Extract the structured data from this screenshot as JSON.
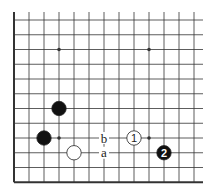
{
  "diagram": {
    "type": "go-board-fragment",
    "region": "lower-left corner",
    "colors": {
      "line": "#333333",
      "black_stone": "#111111",
      "white_stone": "#ffffff",
      "background": "#ffffff"
    },
    "grid": {
      "x0": 14,
      "y0": 20,
      "dx": 15,
      "dy": 14.75,
      "cols": 13,
      "rows": 12,
      "right_extent": 203,
      "top_extent": 12
    },
    "hoshi": [
      {
        "col": 3,
        "row": 2
      },
      {
        "col": 9,
        "row": 2
      },
      {
        "col": 3,
        "row": 8
      },
      {
        "col": 9,
        "row": 8
      }
    ],
    "stones": [
      {
        "color": "black",
        "col": 3,
        "row": 6,
        "label": ""
      },
      {
        "color": "black",
        "col": 2,
        "row": 8,
        "label": ""
      },
      {
        "color": "white",
        "col": 4,
        "row": 9,
        "label": ""
      },
      {
        "color": "white",
        "col": 8,
        "row": 8,
        "label": "1"
      },
      {
        "color": "black",
        "col": 10,
        "row": 9,
        "label": "2"
      }
    ],
    "markers": [
      {
        "col": 6,
        "row": 8,
        "label": "b"
      },
      {
        "col": 6,
        "row": 9,
        "label": "a"
      }
    ]
  }
}
